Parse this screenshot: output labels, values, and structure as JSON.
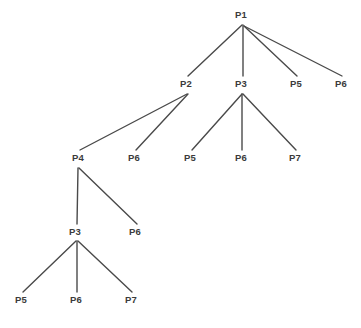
{
  "figure": {
    "title": "",
    "type": "tree-diagram",
    "width": 361,
    "height": 328,
    "background_color": "#ffffff",
    "edge_color": "#4a4a4a",
    "edge_width": 1.4,
    "label_color": "#3b3b3b"
  },
  "nodes": [
    {
      "id": "n0",
      "label": "P1",
      "x": 241,
      "y": 15,
      "depth": 0
    },
    {
      "id": "n1",
      "label": "P2",
      "x": 186,
      "y": 84,
      "depth": 1
    },
    {
      "id": "n2",
      "label": "P3",
      "x": 241,
      "y": 84,
      "depth": 1
    },
    {
      "id": "n3",
      "label": "P5",
      "x": 296,
      "y": 84,
      "depth": 1
    },
    {
      "id": "n4",
      "label": "P6",
      "x": 341,
      "y": 84,
      "depth": 1
    },
    {
      "id": "n5",
      "label": "P4",
      "x": 78,
      "y": 158,
      "depth": 2
    },
    {
      "id": "n6",
      "label": "P6",
      "x": 134,
      "y": 158,
      "depth": 2
    },
    {
      "id": "n7",
      "label": "P5",
      "x": 190,
      "y": 158,
      "depth": 2
    },
    {
      "id": "n8",
      "label": "P6",
      "x": 241,
      "y": 158,
      "depth": 2
    },
    {
      "id": "n9",
      "label": "P7",
      "x": 295,
      "y": 158,
      "depth": 2
    },
    {
      "id": "n10",
      "label": "P3",
      "x": 75,
      "y": 232,
      "depth": 3
    },
    {
      "id": "n11",
      "label": "P6",
      "x": 135,
      "y": 232,
      "depth": 3
    },
    {
      "id": "n12",
      "label": "P5",
      "x": 21,
      "y": 300,
      "depth": 4
    },
    {
      "id": "n13",
      "label": "P6",
      "x": 76,
      "y": 300,
      "depth": 4
    },
    {
      "id": "n14",
      "label": "P7",
      "x": 131,
      "y": 300,
      "depth": 4
    }
  ],
  "edges": [
    {
      "from": "n0",
      "to": "n1",
      "x1": 242,
      "y1": 25,
      "x2": 188,
      "y2": 76
    },
    {
      "from": "n0",
      "to": "n2",
      "x1": 243,
      "y1": 25,
      "x2": 243,
      "y2": 76
    },
    {
      "from": "n0",
      "to": "n3",
      "x1": 244,
      "y1": 26,
      "x2": 297,
      "y2": 76
    },
    {
      "from": "n0",
      "to": "n4",
      "x1": 244,
      "y1": 26,
      "x2": 342,
      "y2": 76
    },
    {
      "from": "n1",
      "to": "n5",
      "x1": 187,
      "y1": 94,
      "x2": 80,
      "y2": 150
    },
    {
      "from": "n1",
      "to": "n6",
      "x1": 188,
      "y1": 94,
      "x2": 136,
      "y2": 150
    },
    {
      "from": "n2",
      "to": "n7",
      "x1": 242,
      "y1": 94,
      "x2": 192,
      "y2": 150
    },
    {
      "from": "n2",
      "to": "n8",
      "x1": 242,
      "y1": 94,
      "x2": 242,
      "y2": 150
    },
    {
      "from": "n2",
      "to": "n9",
      "x1": 243,
      "y1": 94,
      "x2": 296,
      "y2": 150
    },
    {
      "from": "n5",
      "to": "n10",
      "x1": 78,
      "y1": 168,
      "x2": 77,
      "y2": 224
    },
    {
      "from": "n5",
      "to": "n11",
      "x1": 79,
      "y1": 168,
      "x2": 137,
      "y2": 224
    },
    {
      "from": "n10",
      "to": "n12",
      "x1": 76,
      "y1": 241,
      "x2": 23,
      "y2": 292
    },
    {
      "from": "n10",
      "to": "n13",
      "x1": 77,
      "y1": 241,
      "x2": 77,
      "y2": 292
    },
    {
      "from": "n10",
      "to": "n14",
      "x1": 78,
      "y1": 241,
      "x2": 132,
      "y2": 292
    }
  ]
}
